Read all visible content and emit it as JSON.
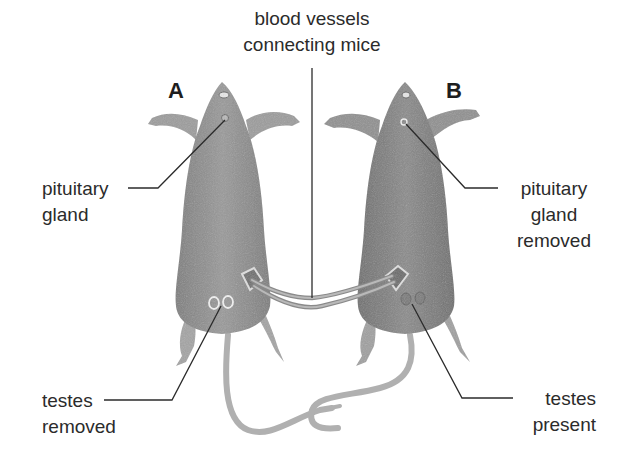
{
  "diagram": {
    "title_label": {
      "lines": [
        "blood vessels",
        "connecting mice"
      ]
    },
    "mice": [
      {
        "id": "A",
        "letter": "A",
        "pituitary_label": [
          "pituitary",
          "gland"
        ],
        "testes_label": [
          "testes",
          "removed"
        ]
      },
      {
        "id": "B",
        "letter": "B",
        "pituitary_label": [
          "pituitary",
          "gland",
          "removed"
        ],
        "testes_label": [
          "testes",
          "present"
        ]
      }
    ],
    "colors": {
      "background": "#ffffff",
      "mouse_fur": "#8f8f8f",
      "mouse_fur_dark": "#7a7a7a",
      "limb": "#a9a9a9",
      "tail": "#b3b3b3",
      "leader_line": "#2b2b2b",
      "text": "#2b2b2b"
    }
  }
}
